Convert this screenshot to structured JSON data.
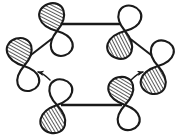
{
  "figure": {
    "type": "orbital-diagram",
    "background_color": "#ffffff",
    "ink_color": "#1a1a1a",
    "shading_style": "diagonal-hatch",
    "ring_geometry": "hexagon",
    "orbital_count": 6,
    "arrow_count": 2
  },
  "orbitals": [
    {
      "id": "orbital-top-left",
      "label": "p-orbital top left",
      "cx": 57,
      "cy": 31,
      "tilt_deg": -18,
      "lobe_top_fill": "shaded",
      "lobe_bottom_fill": "open"
    },
    {
      "id": "orbital-top-right",
      "label": "p-orbital top right",
      "cx": 125,
      "cy": 31,
      "tilt_deg": 18,
      "lobe_top_fill": "open",
      "lobe_bottom_fill": "shaded"
    },
    {
      "id": "orbital-left",
      "label": "p-orbital left",
      "cx": 24,
      "cy": 66,
      "tilt_deg": -16,
      "lobe_top_fill": "shaded",
      "lobe_bottom_fill": "open"
    },
    {
      "id": "orbital-right",
      "label": "p-orbital right",
      "cx": 158,
      "cy": 66,
      "tilt_deg": 16,
      "lobe_top_fill": "open",
      "lobe_bottom_fill": "shaded"
    },
    {
      "id": "orbital-bottom-left",
      "label": "p-orbital bottom left",
      "cx": 57,
      "cy": 105,
      "tilt_deg": 14,
      "lobe_top_fill": "open",
      "lobe_bottom_fill": "shaded"
    },
    {
      "id": "orbital-bottom-right",
      "label": "p-orbital bottom right",
      "cx": 125,
      "cy": 105,
      "tilt_deg": -14,
      "lobe_top_fill": "shaded",
      "lobe_bottom_fill": "open"
    }
  ],
  "bonds": [
    {
      "id": "bond-top",
      "from": "orbital-top-left",
      "to": "orbital-top-right",
      "kind": "horizontal"
    },
    {
      "id": "bond-bottom",
      "from": "orbital-bottom-left",
      "to": "orbital-bottom-right",
      "kind": "horizontal"
    },
    {
      "id": "bond-upper-left",
      "from": "orbital-left",
      "to": "orbital-top-left",
      "kind": "diagonal"
    },
    {
      "id": "bond-upper-right",
      "from": "orbital-top-right",
      "to": "orbital-right",
      "kind": "diagonal"
    }
  ],
  "arrows": [
    {
      "id": "arrow-left",
      "label": "electron flow arrow left",
      "from": "orbital-bottom-left",
      "to": "orbital-left",
      "direction": "up-left",
      "style": "dashed-curved"
    },
    {
      "id": "arrow-right",
      "label": "electron flow arrow right",
      "from": "orbital-bottom-right",
      "to": "orbital-right",
      "direction": "up-right",
      "style": "dashed-curved"
    }
  ]
}
